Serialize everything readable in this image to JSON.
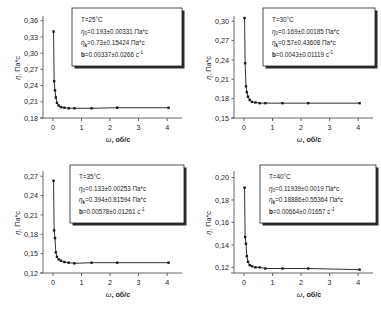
{
  "figure": {
    "axis_x_label_symbol": "ω",
    "axis_x_label_rest": ", об/с",
    "axis_y_label_symbol": "η",
    "axis_y_label_rest": ", Па*с",
    "marker_color": "#1a1a1a",
    "line_color": "#1a1a1a",
    "axis_color": "#555555",
    "box_border_color": "#222222",
    "background": "#ffffff"
  },
  "chart_data": [
    {
      "type": "scatter",
      "panel": "top-left",
      "title": "",
      "xlabel": "ω, об/с",
      "ylabel": "η, Па*с",
      "xlim": [
        -0.35,
        4.45
      ],
      "ylim": [
        0.18,
        0.365
      ],
      "xticks": [
        0,
        1,
        2,
        3,
        4
      ],
      "xticklabels": [
        "0",
        "1",
        "2",
        "3",
        "4"
      ],
      "yticks": [
        0.18,
        0.21,
        0.24,
        0.27,
        0.3,
        0.33,
        0.36
      ],
      "yticklabels": [
        "0,18",
        "0,21",
        "0,24",
        "0,27",
        "0,30",
        "0,33",
        "0,36"
      ],
      "grid": false,
      "x": [
        0.02,
        0.04,
        0.07,
        0.1,
        0.14,
        0.2,
        0.28,
        0.4,
        0.55,
        0.75,
        1.35,
        2.25,
        4.05
      ],
      "y": [
        0.34,
        0.248,
        0.231,
        0.218,
        0.208,
        0.203,
        0.2,
        0.199,
        0.198,
        0.198,
        0.198,
        0.199,
        0.199
      ],
      "annotation": {
        "temperature": "T=25°C",
        "eta0": "η₀=0.193±0.00331 Па*с",
        "etainf": "ηₖ=0.73±0.15424 Па*с",
        "b": "b=0.00337±0.0266 с⁻¹",
        "eta0_sym": "η",
        "eta0_sub": "0",
        "eta0_val": "=0.193±0.00331 Па*с",
        "etainf_sym": "η",
        "etainf_sub": "k",
        "etainf_val": "=0.73±0.15424 Па*с",
        "b_sym": "b",
        "b_val": "=0.00337±0.0266 с",
        "b_sup": "-1"
      }
    },
    {
      "type": "scatter",
      "panel": "top-right",
      "title": "",
      "xlabel": "ω, об/с",
      "ylabel": "η, Па*с",
      "xlim": [
        -0.35,
        4.45
      ],
      "ylim": [
        0.15,
        0.305
      ],
      "xticks": [
        0,
        1,
        2,
        3,
        4
      ],
      "xticklabels": [
        "0",
        "1",
        "2",
        "3",
        "4"
      ],
      "yticks": [
        0.15,
        0.18,
        0.21,
        0.24,
        0.27,
        0.3
      ],
      "yticklabels": [
        "0,15",
        "0,18",
        "0,21",
        "0,24",
        "0,27",
        "0,30"
      ],
      "grid": false,
      "x": [
        0.02,
        0.04,
        0.07,
        0.1,
        0.14,
        0.2,
        0.28,
        0.4,
        0.55,
        0.75,
        1.35,
        2.25,
        4.05
      ],
      "y": [
        0.305,
        0.235,
        0.199,
        0.19,
        0.183,
        0.178,
        0.175,
        0.174,
        0.173,
        0.173,
        0.173,
        0.173,
        0.173
      ],
      "annotation": {
        "temperature": "T=30°C",
        "eta0": "η₀=0.169±0.00185 Па*с",
        "etainf": "ηₖ=0.57±0.43608 Па*с",
        "b": "b=0.0043±0.01119 с⁻¹",
        "eta0_sym": "η",
        "eta0_sub": "0",
        "eta0_val": "=0.169±0.00185 Па*с",
        "etainf_sym": "η",
        "etainf_sub": "k",
        "etainf_val": "=0.57±0.43608 Па*с",
        "b_sym": "b",
        "b_val": "=0.0043±0.01119 с",
        "b_sup": "-1"
      }
    },
    {
      "type": "scatter",
      "panel": "bottom-left",
      "title": "",
      "xlabel": "ω, об/с",
      "ylabel": "η, Па*с",
      "xlim": [
        -0.35,
        4.45
      ],
      "ylim": [
        0.12,
        0.275
      ],
      "xticks": [
        0,
        1,
        2,
        3,
        4
      ],
      "xticklabels": [
        "0",
        "1",
        "2",
        "3",
        "4"
      ],
      "yticks": [
        0.12,
        0.15,
        0.18,
        0.21,
        0.24,
        0.27
      ],
      "yticklabels": [
        "0,12",
        "0,15",
        "0,18",
        "0,21",
        "0,24",
        "0,27"
      ],
      "grid": false,
      "x": [
        0.02,
        0.04,
        0.07,
        0.1,
        0.14,
        0.2,
        0.28,
        0.4,
        0.55,
        0.75,
        1.35,
        2.25,
        4.05
      ],
      "y": [
        0.263,
        0.186,
        0.174,
        0.152,
        0.145,
        0.141,
        0.139,
        0.137,
        0.136,
        0.135,
        0.136,
        0.136,
        0.136
      ],
      "annotation": {
        "temperature": "T=35°C",
        "eta0": "η₀=0.133±0.00253 Па*с",
        "etainf": "ηₖ=0.394±0.81594 Па*с",
        "b": "b=0.00578±0.01261 с⁻¹",
        "eta0_sym": "η",
        "eta0_sub": "0",
        "eta0_val": "=0.133±0.00253 Па*с",
        "etainf_sym": "η",
        "etainf_sub": "k",
        "etainf_val": "=0.394±0.81594 Па*с",
        "b_sym": "b",
        "b_val": "=0.00578±0.01261 с",
        "b_sup": "-1"
      }
    },
    {
      "type": "scatter",
      "panel": "bottom-right",
      "title": "",
      "xlabel": "ω, об/с",
      "ylabel": "η, Па*с",
      "xlim": [
        -0.35,
        4.45
      ],
      "ylim": [
        0.115,
        0.204
      ],
      "xticks": [
        0,
        1,
        2,
        3,
        4
      ],
      "xticklabels": [
        "0",
        "1",
        "2",
        "3",
        "4"
      ],
      "yticks": [
        0.12,
        0.14,
        0.16,
        0.18,
        0.2
      ],
      "yticklabels": [
        "0,12",
        "0,14",
        "0,16",
        "0,18",
        "0,20"
      ],
      "grid": false,
      "x": [
        0.02,
        0.04,
        0.07,
        0.1,
        0.14,
        0.2,
        0.28,
        0.4,
        0.55,
        0.75,
        1.35,
        2.25,
        4.05
      ],
      "y": [
        0.191,
        0.147,
        0.141,
        0.13,
        0.125,
        0.122,
        0.121,
        0.12,
        0.12,
        0.119,
        0.119,
        0.119,
        0.118
      ],
      "annotation": {
        "temperature": "T=40°C",
        "eta0": "η₀=0.11939±0.0019 Па*с",
        "etainf": "ηₖ=0.18886±0.55364 Па*с",
        "b": "b=0.00664±0.01657 с⁻¹",
        "eta0_sym": "η",
        "eta0_sub": "0",
        "eta0_val": "=0.11939±0.0019 Па*с",
        "etainf_sym": "η",
        "etainf_sub": "k",
        "etainf_val": "=0.18886±0.55364 Па*с",
        "b_sym": "b",
        "b_val": "=0.00664±0.01657 с",
        "b_sup": "-1"
      }
    }
  ]
}
